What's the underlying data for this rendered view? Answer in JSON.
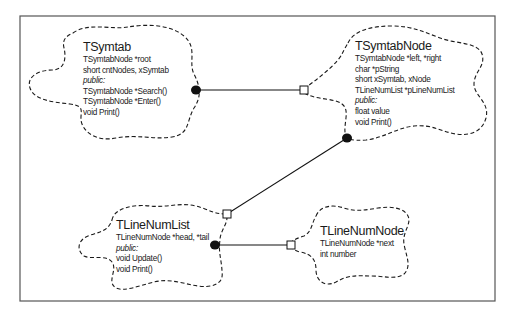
{
  "diagram": {
    "type": "Booch class diagram",
    "classes": [
      {
        "name": "TSymtab",
        "members": [
          "TSymtabNode *root",
          "short cntNodes, xSymtab"
        ],
        "visibility_label": "public:",
        "public_members": [
          "TSymtabNode *Search()",
          "TSymtabNode *Enter()",
          "void Print()"
        ]
      },
      {
        "name": "TSymtabNode",
        "members": [
          "TSymtabNode *left, *right",
          "char *pString",
          "short xSymtab, xNode",
          "TLineNumList *pLineNumList"
        ],
        "visibility_label": "public:",
        "public_members": [
          "float value",
          "void Print()"
        ]
      },
      {
        "name": "TLineNumList",
        "members": [
          "TLineNumNode *head, *tail"
        ],
        "visibility_label": "public:",
        "public_members": [
          "void Update()",
          "void Print()"
        ]
      },
      {
        "name": "TLineNumNode",
        "members": [
          "TLineNumNode *next",
          "int number"
        ],
        "visibility_label": "",
        "public_members": []
      }
    ],
    "relationships": [
      {
        "from": "TSymtab",
        "to": "TSymtabNode",
        "from_end": "filled-circle",
        "to_end": "hollow-square"
      },
      {
        "from": "TSymtabNode",
        "to": "TLineNumList",
        "from_end": "filled-circle",
        "to_end": "hollow-square"
      },
      {
        "from": "TLineNumList",
        "to": "TLineNumNode",
        "from_end": "filled-circle",
        "to_end": "hollow-square"
      }
    ],
    "colors": {
      "line": "#111111",
      "frame": "#555555",
      "background": "#ffffff"
    }
  }
}
